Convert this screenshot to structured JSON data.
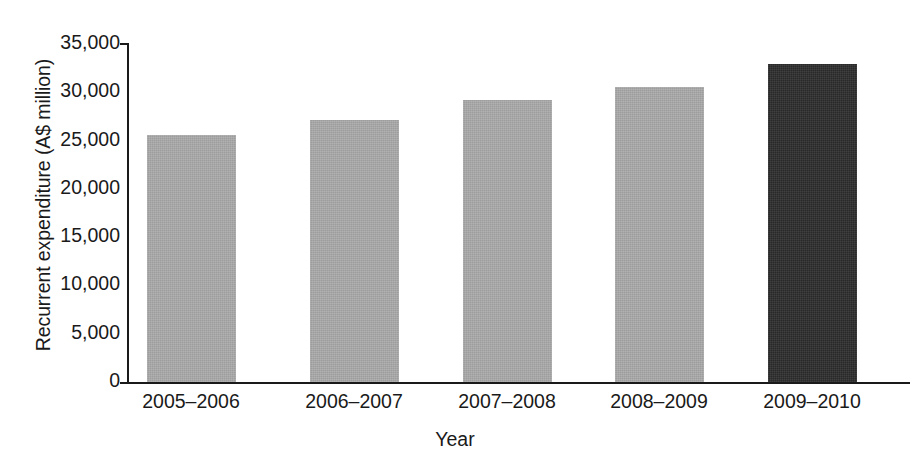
{
  "chart_data": {
    "type": "bar",
    "title": "",
    "subtitle": "",
    "xlabel": "Year",
    "ylabel": "Recurrent expenditure (A$ million)",
    "categories": [
      "2005–2006",
      "2006–2007",
      "2007–2008",
      "2008–2009",
      "2009–2010"
    ],
    "values": [
      25500,
      27100,
      29100,
      30500,
      32800
    ],
    "ylim": [
      0,
      35000
    ],
    "yticks": [
      0,
      5000,
      10000,
      15000,
      20000,
      25000,
      30000,
      35000
    ],
    "ytick_labels": [
      "0",
      "5,000",
      "10,000",
      "15,000",
      "20,000",
      "25,000",
      "30,000",
      "35,000"
    ],
    "grid": false,
    "legend": null,
    "bar_colors": [
      "#a9a9a9",
      "#a9a9a9",
      "#a9a9a9",
      "#a9a9a9",
      "#2b2b2b"
    ],
    "highlight_index": 4,
    "axis_color": "#1a1a1a",
    "background": "#ffffff"
  },
  "axes": {
    "y_title": "Recurrent expenditure (A$ million)",
    "x_title": "Year"
  }
}
